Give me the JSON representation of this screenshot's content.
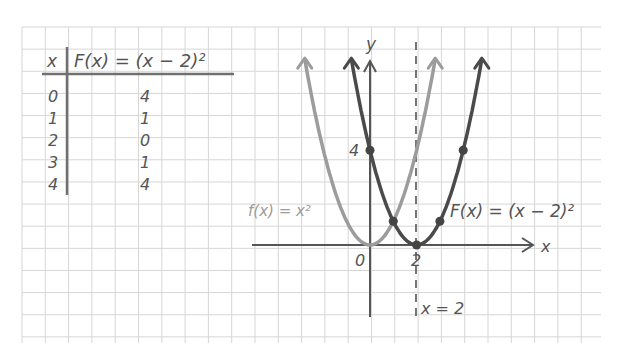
{
  "colors": {
    "background": "#ffffff",
    "grid": "#d6d6d6",
    "ink": "#555555",
    "parent_curve": "#9c9c9c",
    "shifted_curve": "#4a4a4a"
  },
  "table": {
    "header_x": "x",
    "header_fx": "F(x) = (x − 2)²",
    "rows": [
      {
        "x": "0",
        "fx": "4"
      },
      {
        "x": "1",
        "fx": "1"
      },
      {
        "x": "2",
        "fx": "0"
      },
      {
        "x": "3",
        "fx": "1"
      },
      {
        "x": "4",
        "fx": "4"
      }
    ]
  },
  "graph": {
    "x_axis_label": "x",
    "y_axis_label": "y",
    "origin_label": "0",
    "x_tick_label": "2",
    "y_tick_label": "4",
    "parent_label": "f(x) = x²",
    "shifted_label": "F(x) = (x − 2)²",
    "asymptote_label": "x = 2"
  },
  "chart_data": {
    "type": "line",
    "title": "",
    "xlabel": "x",
    "ylabel": "y",
    "grid": true,
    "series": [
      {
        "name": "f(x) = x²",
        "style": "light gray",
        "x": [
          -2,
          -1,
          0,
          1,
          2
        ],
        "y": [
          4,
          1,
          0,
          1,
          4
        ]
      },
      {
        "name": "F(x) = (x − 2)²",
        "style": "dark gray, marked points",
        "x": [
          0,
          1,
          2,
          3,
          4
        ],
        "y": [
          4,
          1,
          0,
          1,
          4
        ]
      }
    ],
    "annotations": [
      "vertical dashed line x = 2",
      "tick 0",
      "tick 2",
      "tick 4"
    ],
    "xlim": [
      -4.5,
      7.5
    ],
    "ylim": [
      -3,
      8
    ]
  }
}
